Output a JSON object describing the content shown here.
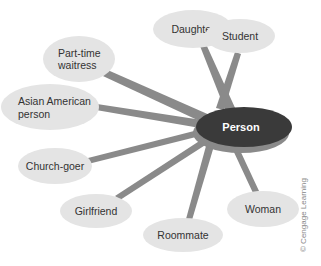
{
  "diagram": {
    "type": "concept-map",
    "center": {
      "label": "Person",
      "fill": "#3a3a3a",
      "rim": "#8a8a8a"
    },
    "nodes": [
      {
        "id": "daughter",
        "lines": [
          "Daughter"
        ]
      },
      {
        "id": "student",
        "lines": [
          "Student"
        ]
      },
      {
        "id": "part-time-waitress",
        "lines": [
          "Part-time",
          "waitress"
        ]
      },
      {
        "id": "asian-american-person",
        "lines": [
          "Asian American",
          "person"
        ]
      },
      {
        "id": "church-goer",
        "lines": [
          "Church-goer"
        ]
      },
      {
        "id": "girlfriend",
        "lines": [
          "Girlfriend"
        ]
      },
      {
        "id": "roommate",
        "lines": [
          "Roommate"
        ]
      },
      {
        "id": "woman",
        "lines": [
          "Woman"
        ]
      }
    ],
    "colors": {
      "node_fill": "#e4e4e4",
      "connector": "#888888",
      "text": "#333333"
    }
  },
  "copyright": "© Cengage Learning"
}
